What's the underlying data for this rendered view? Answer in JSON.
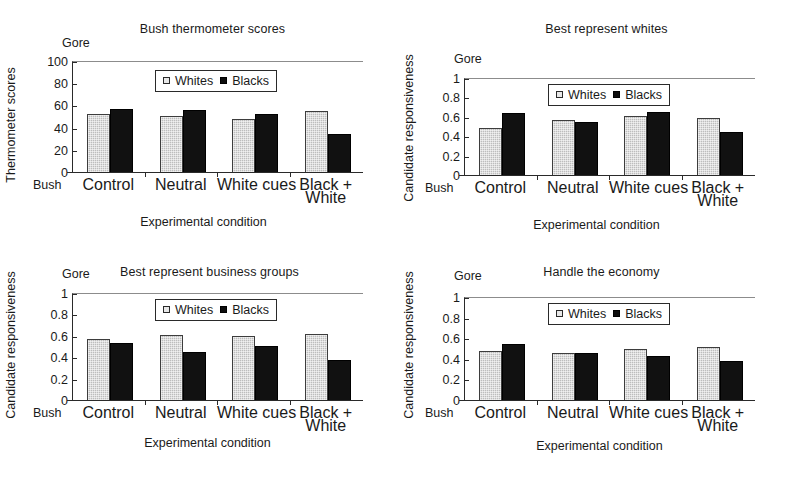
{
  "figure": {
    "panels": [
      {
        "key": "bush_thermometer",
        "title": "Bush thermometer scores",
        "ylabel": "Thermometer scores",
        "xlabel": "Experimental condition",
        "top_axis_tag": "Gore",
        "bottom_axis_tag": "Bush",
        "yticks": [
          "0",
          "20",
          "40",
          "60",
          "80",
          "100"
        ],
        "categories": [
          "Control",
          "Neutral",
          "White cues",
          "Black +|White"
        ],
        "legend": {
          "whites": "Whites",
          "blacks": "Blacks"
        }
      },
      {
        "key": "best_represent_whites",
        "title": "Best represent whites",
        "ylabel": "Candidate responsiveness",
        "xlabel": "Experimental condition",
        "top_axis_tag": "Gore",
        "bottom_axis_tag": "Bush",
        "yticks": [
          "0",
          "0.2",
          "0.4",
          "0.6",
          "0.8",
          "1"
        ],
        "categories": [
          "Control",
          "Neutral",
          "White cues",
          "Black +|White"
        ],
        "legend": {
          "whites": "Whites",
          "blacks": "Blacks"
        }
      },
      {
        "key": "best_represent_business_groups",
        "title": "Best represent business groups",
        "ylabel": "Candidate responsiveness",
        "xlabel": "Experimental condition",
        "top_axis_tag": "Gore",
        "bottom_axis_tag": "Bush",
        "yticks": [
          "0",
          "0.2",
          "0.4",
          "0.6",
          "0.8",
          "1"
        ],
        "categories": [
          "Control",
          "Neutral",
          "White cues",
          "Black +|White"
        ],
        "legend": {
          "whites": "Whites",
          "blacks": "Blacks"
        }
      },
      {
        "key": "handle_the_economy",
        "title": "Handle the economy",
        "ylabel": "Candidate responsiveness",
        "xlabel": "Experimental condition",
        "top_axis_tag": "Gore",
        "bottom_axis_tag": "Bush",
        "yticks": [
          "0",
          "0.2",
          "0.4",
          "0.6",
          "0.8",
          "1"
        ],
        "categories": [
          "Control",
          "Neutral",
          "White cues",
          "Black +|White"
        ],
        "legend": {
          "whites": "Whites",
          "blacks": "Blacks"
        }
      }
    ]
  },
  "chart_data": [
    {
      "type": "bar",
      "title": "Bush thermometer scores",
      "xlabel": "Experimental condition",
      "ylabel": "Thermometer scores",
      "categories": [
        "Control",
        "Neutral",
        "White cues",
        "Black + White"
      ],
      "series": [
        {
          "name": "Whites",
          "values": [
            53,
            51.5,
            49,
            55.5
          ]
        },
        {
          "name": "Blacks",
          "values": [
            58,
            56.5,
            53.5,
            35.5
          ]
        }
      ],
      "ylim": [
        0,
        100
      ],
      "yticks": [
        0,
        20,
        40,
        60,
        80,
        100
      ],
      "axis_top_annotation": "Gore",
      "axis_bottom_annotation": "Bush",
      "grid": false,
      "legend": "inside-top-right"
    },
    {
      "type": "bar",
      "title": "Best represent whites",
      "xlabel": "Experimental condition",
      "ylabel": "Candidate responsiveness",
      "categories": [
        "Control",
        "Neutral",
        "White cues",
        "Black + White"
      ],
      "series": [
        {
          "name": "Whites",
          "values": [
            0.5,
            0.58,
            0.62,
            0.6
          ]
        },
        {
          "name": "Blacks",
          "values": [
            0.65,
            0.56,
            0.66,
            0.45
          ]
        }
      ],
      "ylim": [
        0,
        1
      ],
      "yticks": [
        0,
        0.2,
        0.4,
        0.6,
        0.8,
        1
      ],
      "axis_top_annotation": "Gore",
      "axis_bottom_annotation": "Bush",
      "grid": false,
      "legend": "inside-top-right"
    },
    {
      "type": "bar",
      "title": "Best represent business groups",
      "xlabel": "Experimental condition",
      "ylabel": "Candidate responsiveness",
      "categories": [
        "Control",
        "Neutral",
        "White cues",
        "Black + White"
      ],
      "series": [
        {
          "name": "Whites",
          "values": [
            0.58,
            0.62,
            0.61,
            0.63
          ]
        },
        {
          "name": "Blacks",
          "values": [
            0.54,
            0.46,
            0.51,
            0.38
          ]
        }
      ],
      "ylim": [
        0,
        1
      ],
      "yticks": [
        0,
        0.2,
        0.4,
        0.6,
        0.8,
        1
      ],
      "axis_top_annotation": "Gore",
      "axis_bottom_annotation": "Bush",
      "grid": false,
      "legend": "inside-top-right"
    },
    {
      "type": "bar",
      "title": "Handle the economy",
      "xlabel": "Experimental condition",
      "ylabel": "Candidate responsiveness",
      "categories": [
        "Control",
        "Neutral",
        "White cues",
        "Black + White"
      ],
      "series": [
        {
          "name": "Whites",
          "values": [
            0.49,
            0.465,
            0.505,
            0.525
          ]
        },
        {
          "name": "Blacks",
          "values": [
            0.55,
            0.465,
            0.435,
            0.39
          ]
        }
      ],
      "ylim": [
        0,
        1
      ],
      "yticks": [
        0,
        0.2,
        0.4,
        0.6,
        0.8,
        1
      ],
      "axis_top_annotation": "Gore",
      "axis_bottom_annotation": "Bush",
      "grid": false,
      "legend": "inside-top-right"
    }
  ]
}
